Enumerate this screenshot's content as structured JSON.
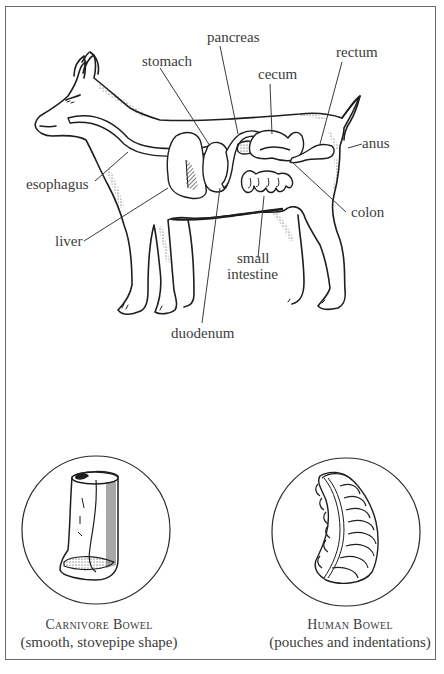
{
  "diagram": {
    "labels": {
      "pancreas": "pancreas",
      "stomach": "stomach",
      "rectum": "rectum",
      "cecum": "cecum",
      "anus": "anus",
      "esophagus": "esophagus",
      "colon": "colon",
      "liver": "liver",
      "small_intestine_1": "small",
      "small_intestine_2": "intestine",
      "duodenum": "duodenum"
    }
  },
  "bowels": {
    "carnivore": {
      "title": "Carnivore Bowel",
      "description": "(smooth, stovepipe shape)"
    },
    "human": {
      "title": "Human Bowel",
      "description": "(pouches and indentations)"
    }
  },
  "colors": {
    "ink": "#1e1e1e",
    "label_text": "#3c3c3c",
    "frame": "#6a6a6a",
    "background": "#ffffff"
  }
}
